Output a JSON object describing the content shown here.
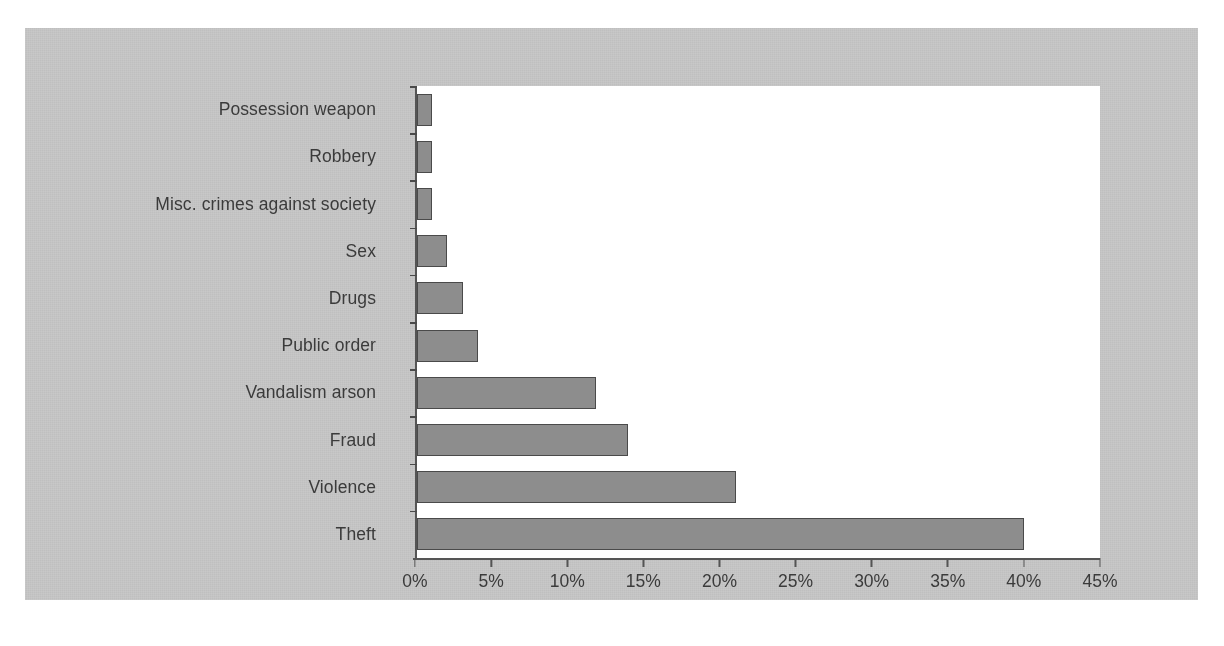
{
  "chart_data": {
    "type": "bar",
    "orientation": "horizontal",
    "title": "",
    "subtitle": "",
    "xlabel": "",
    "ylabel": "",
    "categories": [
      "Possession weapon",
      "Robbery",
      "Misc. crimes against society",
      "Sex",
      "Drugs",
      "Public order",
      "Vandalism arson",
      "Fraud",
      "Violence",
      "Theft"
    ],
    "values": [
      1,
      1,
      1,
      2,
      3,
      4,
      11.8,
      13.9,
      21,
      40
    ],
    "value_suffix": "%",
    "xlim": [
      0,
      45
    ],
    "xticks": [
      0,
      5,
      10,
      15,
      20,
      25,
      30,
      35,
      40,
      45
    ],
    "xtick_labels": [
      "0%",
      "5%",
      "10%",
      "15%",
      "20%",
      "25%",
      "30%",
      "35%",
      "40%",
      "45%"
    ],
    "grid": false,
    "legend": null,
    "legend_position": "none",
    "colors": {
      "bar_fill": "#8d8d8d",
      "bar_border": "#4a4a4a",
      "plot_background": "#ffffff",
      "figure_background": "#c8c8c8",
      "axis_line": "#555555",
      "text": "#3b3b3b"
    }
  }
}
